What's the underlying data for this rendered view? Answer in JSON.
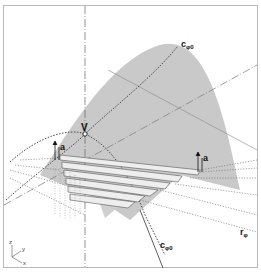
{
  "figure": {
    "type": "geometric-construction",
    "colors": {
      "frame": "#b8b8b8",
      "surface": "#c9c9c9",
      "ribbon_fill": "#eeeeee",
      "ribbon_stroke": "#555555",
      "line": "#333333",
      "dash_line": "#666666"
    },
    "labels": {
      "curve_top": {
        "main": "c",
        "sub": "φ0"
      },
      "vertex": "V",
      "vector_left": "a",
      "vector_right": "a",
      "curve_bottom": {
        "main": "c",
        "sub": "φ0"
      },
      "ruling": {
        "main": "r",
        "sub": "φ"
      }
    },
    "axes_triad": {
      "z": "z",
      "y": "y",
      "x": "x"
    }
  }
}
